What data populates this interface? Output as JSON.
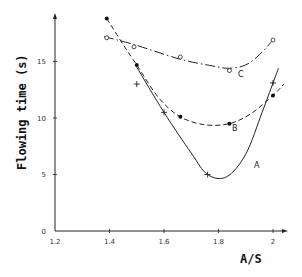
{
  "chart_data": {
    "type": "line",
    "title": "",
    "xlabel": "A/S",
    "ylabel": "Flowing time (s)",
    "xlim": [
      1.2,
      2.05
    ],
    "ylim": [
      0,
      20
    ],
    "x_ticks": [
      "1.2",
      "1.4",
      "1.6",
      "1.8",
      "2"
    ],
    "y_ticks": [
      "0",
      "5",
      "10",
      "15"
    ],
    "grid": false,
    "legend": "inline curve labels",
    "series": [
      {
        "name": "A",
        "line_style": "solid",
        "marker": "plus",
        "points": [
          [
            1.5,
            13.0
          ],
          [
            1.6,
            10.5
          ],
          [
            1.76,
            5.0
          ],
          [
            2.0,
            13.1
          ]
        ],
        "curve": [
          [
            1.5,
            14.5
          ],
          [
            1.6,
            10.5
          ],
          [
            1.7,
            6.9
          ],
          [
            1.76,
            5.0
          ],
          [
            1.83,
            4.8
          ],
          [
            1.9,
            6.8
          ],
          [
            1.96,
            10.5
          ],
          [
            2.0,
            13.1
          ],
          [
            2.02,
            14.4
          ]
        ]
      },
      {
        "name": "B",
        "line_style": "dashed",
        "marker": "filled-circle",
        "points": [
          [
            1.39,
            18.8
          ],
          [
            1.5,
            14.7
          ],
          [
            1.66,
            10.1
          ],
          [
            1.84,
            9.5
          ],
          [
            2.0,
            12.0
          ]
        ],
        "curve": [
          [
            1.39,
            18.8
          ],
          [
            1.45,
            16.5
          ],
          [
            1.5,
            14.7
          ],
          [
            1.58,
            11.8
          ],
          [
            1.66,
            10.1
          ],
          [
            1.75,
            9.4
          ],
          [
            1.84,
            9.5
          ],
          [
            1.92,
            10.4
          ],
          [
            2.0,
            12.0
          ],
          [
            2.04,
            13.0
          ]
        ]
      },
      {
        "name": "C",
        "line_style": "dash-dot",
        "marker": "open-circle",
        "points": [
          [
            1.39,
            17.1
          ],
          [
            1.49,
            16.3
          ],
          [
            1.66,
            15.4
          ],
          [
            1.84,
            14.2
          ],
          [
            2.0,
            16.9
          ]
        ],
        "curve": [
          [
            1.38,
            17.2
          ],
          [
            1.49,
            16.5
          ],
          [
            1.66,
            15.2
          ],
          [
            1.78,
            14.6
          ],
          [
            1.84,
            14.4
          ],
          [
            1.9,
            14.7
          ],
          [
            1.95,
            15.6
          ],
          [
            2.0,
            16.9
          ]
        ]
      }
    ],
    "annotations": [
      "A",
      "B",
      "C"
    ]
  },
  "axes": {
    "x_title": "A/S",
    "y_title": "Flowing time (s)"
  },
  "labels": {
    "A": "A",
    "B": "B",
    "C": "C"
  }
}
